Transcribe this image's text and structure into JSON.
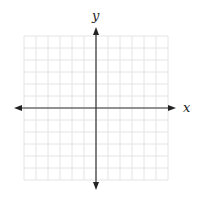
{
  "diagram": {
    "type": "coordinate-plane",
    "x_axis_label": "x",
    "y_axis_label": "y",
    "grid": {
      "cells_x": 12,
      "cells_y": 12,
      "left": 24,
      "top": 36,
      "cell_size": 12,
      "line_color": "#e4e4e4"
    },
    "axes": {
      "origin_x": 96,
      "origin_y": 108,
      "x_start": 14,
      "x_end": 176,
      "y_start": 27,
      "y_end": 190,
      "color": "#333333"
    }
  }
}
